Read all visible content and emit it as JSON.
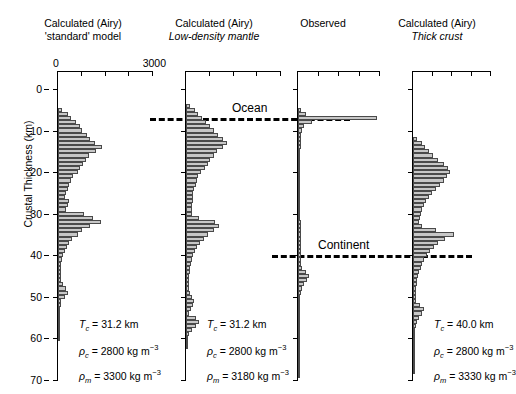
{
  "axis": {
    "y_label": "Crustal Thickness (km)",
    "y_ticks": [
      "0",
      "10",
      "20",
      "30",
      "40",
      "50",
      "60",
      "70"
    ],
    "y_min": 0,
    "y_max": 70,
    "x_min_label": "0",
    "x_max_label": "3000",
    "x_min": 0,
    "x_max": 3000
  },
  "reference_lines": [
    {
      "label": "Ocean",
      "depth_km": 7
    },
    {
      "label": "Continent",
      "depth_km": 40
    }
  ],
  "panels": [
    {
      "id": "standard",
      "title_line1": "Calculated (Airy)",
      "title_line2": "'standard' model",
      "title_line2_italic": false,
      "tc_label": "T",
      "tc_sub": "c",
      "tc_value": "= 31.2 km",
      "rho_c_value": "= 2800 kg m",
      "rho_m_value": "= 3300 kg m",
      "sup": "−3"
    },
    {
      "id": "low-density-mantle",
      "title_line1": "Calculated (Airy)",
      "title_line2": "Low-density mantle",
      "title_line2_italic": true,
      "tc_label": "T",
      "tc_sub": "c",
      "tc_value": "= 31.2 km",
      "rho_c_value": "= 2800 kg m",
      "rho_m_value": "= 3180 kg m",
      "sup": "−3"
    },
    {
      "id": "observed",
      "title_line1": "Observed",
      "title_line2": "",
      "title_line2_italic": false,
      "tc_label": "",
      "tc_sub": "",
      "tc_value": "",
      "rho_c_value": "",
      "rho_m_value": "",
      "sup": ""
    },
    {
      "id": "thick-crust",
      "title_line1": "Calculated (Airy)",
      "title_line2": "Thick crust",
      "title_line2_italic": true,
      "tc_label": "T",
      "tc_sub": "c",
      "tc_value": "= 40.0 km",
      "rho_c_value": "= 2800 kg m",
      "rho_m_value": "= 3330 kg m",
      "sup": "−3"
    }
  ],
  "chart_data": {
    "type": "bar",
    "orientation": "horizontal",
    "title": "",
    "xlabel": "",
    "ylabel": "Crustal Thickness (km)",
    "xlim": [
      0,
      3000
    ],
    "ylim": [
      0,
      70
    ],
    "grid": false,
    "legend": null,
    "bin_width_km": 1,
    "annotations": [
      {
        "text": "Ocean",
        "y_km": 7
      },
      {
        "text": "Continent",
        "y_km": 40
      }
    ],
    "series": [
      {
        "name": "Calculated (Airy) 'standard' model",
        "bin_centers_km": [
          5,
          6,
          7,
          8,
          9,
          10,
          11,
          12,
          13,
          14,
          15,
          16,
          17,
          18,
          19,
          20,
          21,
          22,
          23,
          24,
          25,
          26,
          27,
          28,
          29,
          30,
          31,
          32,
          33,
          34,
          35,
          36,
          37,
          38,
          39,
          40,
          41,
          42,
          43,
          44,
          45,
          46,
          47,
          48,
          49,
          50,
          51,
          52,
          53,
          54,
          55,
          56,
          57,
          58,
          59,
          60
        ],
        "values": [
          140,
          330,
          420,
          560,
          700,
          760,
          900,
          1010,
          1180,
          1390,
          1190,
          990,
          890,
          790,
          700,
          620,
          480,
          400,
          350,
          300,
          260,
          230,
          340,
          300,
          260,
          820,
          1120,
          1360,
          1000,
          760,
          620,
          430,
          360,
          290,
          220,
          150,
          120,
          110,
          95,
          90,
          85,
          80,
          150,
          250,
          300,
          230,
          110,
          80,
          60,
          40,
          25,
          15,
          10,
          8,
          5,
          3
        ]
      },
      {
        "name": "Calculated (Airy) Low-density mantle",
        "bin_centers_km": [
          4,
          5,
          6,
          7,
          8,
          9,
          10,
          11,
          12,
          13,
          14,
          15,
          16,
          17,
          18,
          19,
          20,
          21,
          22,
          23,
          24,
          25,
          26,
          27,
          28,
          29,
          30,
          31,
          32,
          33,
          34,
          35,
          36,
          37,
          38,
          39,
          40,
          41,
          42,
          43,
          44,
          45,
          46,
          47,
          48,
          49,
          50,
          51,
          52,
          53,
          54,
          55,
          56,
          57,
          58,
          59,
          60,
          61,
          62
        ],
        "values": [
          130,
          280,
          380,
          520,
          640,
          760,
          880,
          1010,
          1180,
          1310,
          1160,
          980,
          880,
          760,
          680,
          600,
          470,
          390,
          340,
          300,
          260,
          230,
          220,
          210,
          200,
          190,
          180,
          420,
          900,
          1050,
          880,
          700,
          560,
          430,
          350,
          280,
          230,
          190,
          160,
          140,
          120,
          110,
          100,
          95,
          90,
          130,
          200,
          260,
          210,
          150,
          110,
          330,
          420,
          300,
          180,
          90,
          50,
          25,
          10
        ]
      },
      {
        "name": "Observed",
        "bin_centers_km": [
          5,
          6,
          7,
          8,
          9,
          10,
          11,
          12,
          13,
          14,
          15,
          16,
          17,
          18,
          19,
          20,
          21,
          22,
          23,
          24,
          25,
          26,
          27,
          28,
          29,
          30,
          31,
          32,
          33,
          34,
          35,
          36,
          37,
          38,
          39,
          40,
          41,
          42,
          43,
          44,
          45,
          46,
          47,
          48,
          49,
          50,
          51,
          52,
          53,
          54,
          55,
          56,
          57,
          58,
          59,
          60,
          61,
          62,
          63,
          64,
          65,
          66,
          67,
          68,
          69
        ],
        "values": [
          120,
          300,
          2900,
          520,
          230,
          150,
          120,
          110,
          100,
          95,
          90,
          85,
          85,
          80,
          80,
          80,
          80,
          80,
          80,
          80,
          80,
          85,
          85,
          85,
          90,
          90,
          90,
          95,
          95,
          100,
          100,
          100,
          100,
          105,
          105,
          110,
          110,
          120,
          130,
          300,
          420,
          320,
          230,
          150,
          110,
          90,
          80,
          70,
          65,
          60,
          55,
          50,
          45,
          40,
          35,
          30,
          28,
          25,
          22,
          20,
          18,
          16,
          14,
          12,
          10
        ]
      },
      {
        "name": "Calculated (Airy) Thick crust",
        "bin_centers_km": [
          12,
          13,
          14,
          15,
          16,
          17,
          18,
          19,
          20,
          21,
          22,
          23,
          24,
          25,
          26,
          27,
          28,
          29,
          30,
          31,
          32,
          33,
          34,
          35,
          36,
          37,
          38,
          39,
          40,
          41,
          42,
          43,
          44,
          45,
          46,
          47,
          48,
          49,
          50,
          51,
          52,
          53,
          54,
          55,
          56,
          57,
          58,
          59,
          60,
          61,
          62,
          63,
          64,
          65,
          66,
          67,
          68
        ],
        "values": [
          150,
          330,
          460,
          600,
          760,
          950,
          1180,
          1330,
          1420,
          1320,
          1180,
          1020,
          880,
          740,
          620,
          500,
          420,
          340,
          290,
          250,
          220,
          340,
          900,
          1560,
          1230,
          980,
          800,
          640,
          520,
          420,
          350,
          290,
          240,
          200,
          170,
          150,
          130,
          120,
          110,
          100,
          280,
          420,
          330,
          230,
          150,
          100,
          80,
          60,
          45,
          35,
          25,
          18,
          12,
          9,
          7,
          5,
          3
        ]
      }
    ]
  }
}
